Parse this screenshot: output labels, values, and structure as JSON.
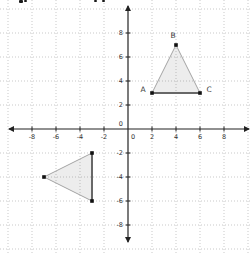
{
  "meta": {
    "width": 252,
    "height": 255,
    "background": "#ffffff"
  },
  "artifacts": {
    "description": "bottoms of cropped text letters at top edge",
    "top_text_fragments": [
      {
        "x": 19,
        "y": 0,
        "w": 4,
        "h": 3
      },
      {
        "x": 24,
        "y": 0,
        "w": 3,
        "h": 2
      },
      {
        "x": 94,
        "y": 0,
        "w": 3,
        "h": 2
      },
      {
        "x": 102,
        "y": 0,
        "w": 3,
        "h": 2
      }
    ]
  },
  "graph": {
    "origin_px": {
      "x": 128,
      "y": 129
    },
    "px_per_unit": 12,
    "grid": {
      "step": 2,
      "min": -10,
      "max": 10,
      "color": "#c9c9c9",
      "dash": "1 2"
    },
    "axes": {
      "color": "#222222",
      "x": {
        "from_px": 9,
        "to_px": 249
      },
      "y": {
        "from_px": 6,
        "to_px": 242
      }
    },
    "ticks": {
      "x": [
        -8,
        -6,
        -4,
        -2,
        0,
        2,
        4,
        6,
        8
      ],
      "y": [
        8,
        6,
        4,
        2,
        0,
        -2,
        -4,
        -6,
        -8
      ],
      "label_color": "#333333",
      "font_size": 6.5
    },
    "triangles": [
      {
        "name": "triangle-ABC",
        "fill": "rgba(80,80,80,0.10)",
        "edge_color": "#a3a3a3",
        "thick_edge": {
          "from": 0,
          "to": 2,
          "color": "#686868",
          "width": 2
        },
        "point_color": "#111111",
        "label_color": "#3a3a3a",
        "vertices": [
          {
            "label": "A",
            "x": 2,
            "y": 3,
            "label_dx": -9,
            "label_dy": -4
          },
          {
            "label": "B",
            "x": 4,
            "y": 7,
            "label_dx": -3,
            "label_dy": -10
          },
          {
            "label": "C",
            "x": 6,
            "y": 3,
            "label_dx": 9,
            "label_dy": -4
          }
        ]
      },
      {
        "name": "triangle-image",
        "fill": "rgba(80,80,80,0.10)",
        "edge_color": "#a3a3a3",
        "thick_edge": {
          "from": 0,
          "to": 2,
          "color": "#686868",
          "width": 2
        },
        "point_color": "#111111",
        "label_color": "#3a3a3a",
        "vertices": [
          {
            "label": "",
            "x": -3,
            "y": -2,
            "label_dx": 0,
            "label_dy": 0
          },
          {
            "label": "",
            "x": -7,
            "y": -4,
            "label_dx": 0,
            "label_dy": 0
          },
          {
            "label": "",
            "x": -3,
            "y": -6,
            "label_dx": 0,
            "label_dy": 0
          }
        ]
      }
    ]
  }
}
